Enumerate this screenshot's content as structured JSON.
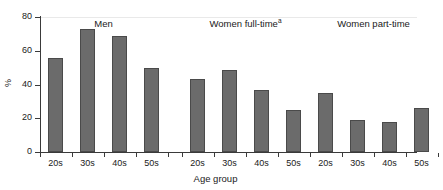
{
  "chart_data": {
    "type": "bar",
    "title": "",
    "xlabel": "Age group",
    "ylabel": "%",
    "ylim": [
      0,
      80
    ],
    "yticks": [
      0,
      20,
      40,
      60,
      80
    ],
    "ytick_labels": [
      "0",
      "20",
      "40",
      "60",
      "80"
    ],
    "grid": false,
    "legend_position": "none",
    "categories": [
      "20s",
      "30s",
      "40s",
      "50s"
    ],
    "groups": [
      {
        "name": "Men",
        "label": "Men",
        "superscript": "",
        "categories": [
          "20s",
          "30s",
          "40s",
          "50s"
        ],
        "values": [
          56,
          73,
          69,
          50
        ]
      },
      {
        "name": "Women full-time",
        "label": "Women full-time",
        "superscript": "a",
        "categories": [
          "20s",
          "30s",
          "40s",
          "50s"
        ],
        "values": [
          43,
          48.5,
          37,
          25
        ]
      },
      {
        "name": "Women part-time",
        "label": "Women part-time",
        "superscript": "",
        "categories": [
          "20s",
          "30s",
          "40s",
          "50s"
        ],
        "values": [
          35,
          19,
          18,
          26
        ]
      }
    ],
    "series": [
      {
        "name": "Men",
        "values": [
          56,
          73,
          69,
          50
        ]
      },
      {
        "name": "Women full-time",
        "values": [
          43,
          48.5,
          37,
          25
        ]
      },
      {
        "name": "Women part-time",
        "values": [
          35,
          19,
          18,
          26
        ]
      }
    ],
    "bar_color": "#6b6b6b",
    "bar_edge_color": "#4a4a4a",
    "axis_color": "#3a3a3a",
    "background_color": "#ffffff"
  }
}
